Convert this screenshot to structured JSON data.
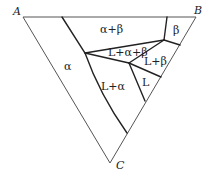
{
  "diagram": {
    "type": "ternary-phase-diagram-isothermal-section",
    "corners": {
      "A": "A",
      "B": "B",
      "C": "C"
    },
    "regions": {
      "alpha_beta": "α+β",
      "beta": "β",
      "l_alpha_beta": "L+α+β",
      "l_beta": "L+β",
      "alpha": "α",
      "l": "L",
      "l_alpha": "L+α"
    },
    "colors": {
      "outline": "#555555",
      "boundary": "#222222",
      "background": "#ffffff"
    }
  }
}
